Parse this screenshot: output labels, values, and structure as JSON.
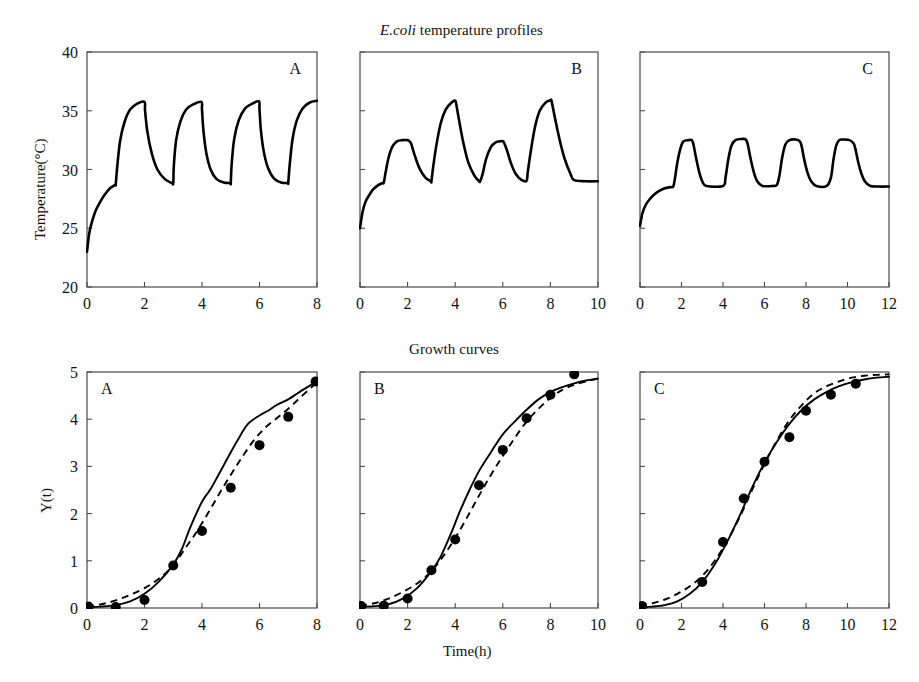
{
  "figure": {
    "top_title": "E.coli temperature profiles",
    "top_title_italic_part": "E.coli",
    "top_title_rest": " temperature profiles",
    "bottom_title": "Growth curves",
    "x_axis_label": "Time(h)",
    "top_y_axis_label": "Temperature(°C)",
    "bottom_y_axis_label": "Y(t)"
  },
  "chart_data": [
    {
      "type": "line",
      "id": "temperature-profile-a",
      "panel_letter": "A",
      "title": "E.coli temperature profiles",
      "xlabel": "",
      "ylabel": "Temperature(°C)",
      "xlim": [
        0,
        8
      ],
      "ylim": [
        20,
        40
      ],
      "xticks": [
        0,
        2,
        4,
        6,
        8
      ],
      "yticks": [
        20,
        25,
        30,
        35,
        40
      ],
      "xticklabels": [
        "0",
        "2",
        "4",
        "6",
        "8"
      ],
      "yticklabels": [
        "20",
        "25",
        "30",
        "35",
        "40"
      ],
      "grid": false,
      "legend": "none",
      "series": [
        {
          "name": "temperature",
          "x": [
            0,
            0.08,
            0.18,
            0.3,
            0.45,
            0.6,
            0.8,
            0.98,
            1.0,
            1.05,
            1.15,
            1.3,
            1.5,
            1.75,
            2.0,
            2.02,
            2.1,
            2.25,
            2.45,
            2.7,
            2.95,
            3.0,
            3.02,
            3.1,
            3.25,
            3.45,
            3.7,
            3.98,
            4.0,
            4.05,
            4.15,
            4.3,
            4.5,
            4.75,
            4.98,
            5.0,
            5.03,
            5.12,
            5.28,
            5.5,
            5.75,
            5.98,
            6.0,
            6.05,
            6.15,
            6.3,
            6.5,
            6.75,
            6.98,
            7.0,
            7.05,
            7.15,
            7.3,
            7.5,
            7.75,
            8.0
          ],
          "y": [
            23.0,
            24.6,
            25.6,
            26.5,
            27.2,
            27.8,
            28.4,
            28.7,
            28.75,
            30.2,
            32.4,
            34.0,
            35.1,
            35.6,
            35.75,
            35.0,
            33.2,
            31.4,
            30.0,
            29.2,
            28.85,
            28.85,
            30.3,
            32.5,
            34.1,
            35.1,
            35.55,
            35.75,
            35.1,
            33.3,
            31.4,
            30.0,
            29.2,
            28.9,
            28.85,
            28.85,
            30.4,
            32.6,
            34.2,
            35.2,
            35.6,
            35.8,
            35.1,
            33.3,
            31.5,
            30.1,
            29.25,
            28.9,
            28.85,
            28.9,
            30.4,
            32.6,
            34.2,
            35.2,
            35.7,
            35.85
          ]
        }
      ]
    },
    {
      "type": "line",
      "id": "temperature-profile-b",
      "panel_letter": "B",
      "title": "E.coli temperature profiles",
      "xlabel": "",
      "ylabel": "",
      "xlim": [
        0,
        10
      ],
      "ylim": [
        20,
        40
      ],
      "xticks": [
        0,
        2,
        4,
        6,
        8,
        10
      ],
      "yticks": [
        20,
        25,
        30,
        35,
        40
      ],
      "xticklabels": [
        "0",
        "2",
        "4",
        "6",
        "8",
        "10"
      ],
      "yticklabels": [
        "",
        "",
        "",
        "",
        ""
      ],
      "grid": false,
      "legend": "none",
      "series": [
        {
          "name": "temperature",
          "x": [
            0,
            0.1,
            0.22,
            0.38,
            0.55,
            0.75,
            0.95,
            1.0,
            1.08,
            1.2,
            1.35,
            1.55,
            1.8,
            2.0,
            2.05,
            2.15,
            2.3,
            2.5,
            2.75,
            2.98,
            3.0,
            3.08,
            3.22,
            3.4,
            3.6,
            3.85,
            4.0,
            4.05,
            4.18,
            4.35,
            4.55,
            4.8,
            5.0,
            5.05,
            5.15,
            5.3,
            5.5,
            5.7,
            5.9,
            6.0,
            6.05,
            6.18,
            6.35,
            6.55,
            6.8,
            7.0,
            7.05,
            7.18,
            7.35,
            7.55,
            7.8,
            8.0,
            8.05,
            8.18,
            8.38,
            8.6,
            8.85,
            9.0,
            9.5,
            10.0
          ],
          "y": [
            25.0,
            26.3,
            27.2,
            27.8,
            28.3,
            28.65,
            28.85,
            28.9,
            29.8,
            31.0,
            31.9,
            32.4,
            32.5,
            32.5,
            32.45,
            32.2,
            31.2,
            30.1,
            29.3,
            29.0,
            29.0,
            30.3,
            32.2,
            34.0,
            35.1,
            35.7,
            35.85,
            35.5,
            34.0,
            32.2,
            30.6,
            29.5,
            29.0,
            29.0,
            29.6,
            30.9,
            31.9,
            32.3,
            32.4,
            32.4,
            32.3,
            31.6,
            30.5,
            29.6,
            29.1,
            29.05,
            29.8,
            31.6,
            33.6,
            35.0,
            35.7,
            35.9,
            35.8,
            34.5,
            32.6,
            30.9,
            29.6,
            29.1,
            29.0,
            29.0
          ]
        }
      ]
    },
    {
      "type": "line",
      "id": "temperature-profile-c",
      "panel_letter": "C",
      "title": "E.coli temperature profiles",
      "xlabel": "",
      "ylabel": "",
      "xlim": [
        0,
        12
      ],
      "ylim": [
        20,
        40
      ],
      "xticks": [
        0,
        2,
        4,
        6,
        8,
        10,
        12
      ],
      "yticks": [
        20,
        25,
        30,
        35,
        40
      ],
      "xticklabels": [
        "0",
        "2",
        "4",
        "6",
        "8",
        "10",
        "12"
      ],
      "yticklabels": [
        "",
        "",
        "",
        "",
        ""
      ],
      "grid": false,
      "legend": "none",
      "series": [
        {
          "name": "temperature",
          "x": [
            0,
            0.12,
            0.28,
            0.48,
            0.7,
            0.95,
            1.2,
            1.45,
            1.6,
            1.68,
            1.8,
            1.95,
            2.1,
            2.35,
            2.5,
            2.58,
            2.7,
            2.85,
            3.0,
            3.2,
            4.0,
            4.12,
            4.25,
            4.4,
            4.6,
            4.9,
            5.1,
            5.2,
            5.32,
            5.48,
            5.65,
            5.9,
            6.4,
            6.6,
            6.72,
            6.85,
            7.0,
            7.2,
            7.5,
            7.7,
            7.8,
            7.92,
            8.08,
            8.25,
            8.5,
            9.0,
            9.2,
            9.32,
            9.45,
            9.6,
            9.8,
            10.1,
            10.3,
            10.4,
            10.52,
            10.68,
            10.85,
            11.1,
            11.5,
            12.0
          ],
          "y": [
            25.2,
            26.3,
            27.0,
            27.5,
            27.9,
            28.2,
            28.4,
            28.5,
            28.55,
            29.2,
            30.6,
            31.8,
            32.4,
            32.5,
            32.5,
            32.1,
            31.0,
            29.8,
            29.0,
            28.6,
            28.6,
            29.3,
            30.8,
            32.0,
            32.5,
            32.6,
            32.55,
            32.1,
            31.0,
            29.8,
            29.0,
            28.6,
            28.6,
            28.7,
            29.5,
            31.0,
            32.1,
            32.5,
            32.55,
            32.4,
            31.9,
            30.8,
            29.7,
            29.0,
            28.6,
            28.6,
            29.3,
            30.8,
            32.0,
            32.5,
            32.55,
            32.5,
            32.2,
            31.6,
            30.6,
            29.6,
            28.95,
            28.6,
            28.55,
            28.55
          ]
        }
      ]
    },
    {
      "type": "line",
      "id": "growth-curve-a",
      "panel_letter": "A",
      "title": "Growth curves",
      "xlabel": "Time(h)",
      "ylabel": "Y(t)",
      "xlim": [
        0,
        8
      ],
      "ylim": [
        0,
        5
      ],
      "xticks": [
        0,
        2,
        4,
        6,
        8
      ],
      "yticks": [
        0,
        1,
        2,
        3,
        4,
        5
      ],
      "xticklabels": [
        "0",
        "2",
        "4",
        "6",
        "8"
      ],
      "yticklabels": [
        "0",
        "1",
        "2",
        "3",
        "4",
        "5"
      ],
      "grid": false,
      "legend": "none",
      "series": [
        {
          "name": "model-solid",
          "style": "solid",
          "x": [
            0,
            0.5,
            1.0,
            1.5,
            2.0,
            2.5,
            3.0,
            3.3,
            3.6,
            4.0,
            4.3,
            4.6,
            5.0,
            5.3,
            5.6,
            6.0,
            6.3,
            6.6,
            7.0,
            7.4,
            8.0
          ],
          "y": [
            0.02,
            0.03,
            0.06,
            0.14,
            0.3,
            0.56,
            0.92,
            1.25,
            1.72,
            2.25,
            2.52,
            2.85,
            3.3,
            3.62,
            3.9,
            4.08,
            4.18,
            4.3,
            4.42,
            4.58,
            4.8
          ]
        },
        {
          "name": "model-dashed",
          "style": "dashed",
          "x": [
            0,
            0.5,
            1.0,
            1.5,
            2.0,
            2.5,
            3.0,
            3.4,
            3.8,
            4.2,
            4.6,
            5.0,
            5.4,
            5.8,
            6.2,
            6.6,
            7.0,
            7.4,
            8.0
          ],
          "y": [
            0.03,
            0.08,
            0.16,
            0.28,
            0.42,
            0.62,
            0.9,
            1.25,
            1.6,
            2.0,
            2.42,
            2.82,
            3.2,
            3.55,
            3.82,
            4.02,
            4.22,
            4.45,
            4.78
          ]
        }
      ],
      "points": {
        "x": [
          0.05,
          1.0,
          2.0,
          3.0,
          4.0,
          5.0,
          6.0,
          7.0,
          7.95
        ],
        "y": [
          0.03,
          0.02,
          0.17,
          0.9,
          1.63,
          2.55,
          3.45,
          4.05,
          4.8
        ]
      }
    },
    {
      "type": "line",
      "id": "growth-curve-b",
      "panel_letter": "B",
      "title": "Growth curves",
      "xlabel": "Time(h)",
      "ylabel": "",
      "xlim": [
        0,
        10
      ],
      "ylim": [
        0,
        5
      ],
      "xticks": [
        0,
        2,
        4,
        6,
        8,
        10
      ],
      "yticks": [
        0,
        1,
        2,
        3,
        4,
        5
      ],
      "xticklabels": [
        "0",
        "2",
        "4",
        "6",
        "8",
        "10"
      ],
      "yticklabels": [
        "",
        "",
        "",
        "",
        "",
        ""
      ],
      "grid": false,
      "legend": "none",
      "series": [
        {
          "name": "model-solid",
          "style": "solid",
          "x": [
            0,
            0.6,
            1.2,
            1.8,
            2.4,
            3.0,
            3.4,
            3.8,
            4.2,
            4.6,
            5.0,
            5.5,
            6.0,
            6.5,
            7.0,
            7.5,
            8.0,
            8.5,
            9.0,
            9.5,
            10.0
          ],
          "y": [
            0.02,
            0.04,
            0.08,
            0.2,
            0.42,
            0.78,
            1.1,
            1.55,
            2.05,
            2.5,
            2.9,
            3.3,
            3.68,
            3.95,
            4.2,
            4.42,
            4.58,
            4.68,
            4.76,
            4.82,
            4.86
          ]
        },
        {
          "name": "model-dashed",
          "style": "dashed",
          "x": [
            0,
            0.6,
            1.2,
            1.8,
            2.4,
            3.0,
            3.5,
            4.0,
            4.5,
            5.0,
            5.5,
            6.0,
            6.5,
            7.0,
            7.5,
            8.0,
            8.5,
            9.0,
            9.5,
            10.0
          ],
          "y": [
            0.05,
            0.1,
            0.2,
            0.34,
            0.52,
            0.78,
            1.1,
            1.48,
            1.92,
            2.38,
            2.82,
            3.22,
            3.6,
            3.95,
            4.22,
            4.45,
            4.62,
            4.73,
            4.8,
            4.86
          ]
        }
      ],
      "points": {
        "x": [
          0.05,
          1.0,
          2.0,
          3.0,
          4.0,
          5.0,
          6.0,
          7.0,
          8.0,
          9.0
        ],
        "y": [
          0.04,
          0.05,
          0.2,
          0.8,
          1.45,
          2.6,
          3.35,
          4.02,
          4.52,
          4.95
        ]
      }
    },
    {
      "type": "line",
      "id": "growth-curve-c",
      "panel_letter": "C",
      "title": "Growth curves",
      "xlabel": "Time(h)",
      "ylabel": "",
      "xlim": [
        0,
        12
      ],
      "ylim": [
        0,
        5
      ],
      "xticks": [
        0,
        2,
        4,
        6,
        8,
        10,
        12
      ],
      "yticks": [
        0,
        1,
        2,
        3,
        4,
        5
      ],
      "xticklabels": [
        "0",
        "2",
        "4",
        "6",
        "8",
        "10",
        "12"
      ],
      "yticklabels": [
        "",
        "",
        "",
        "",
        "",
        ""
      ],
      "grid": false,
      "legend": "none",
      "series": [
        {
          "name": "model-solid",
          "style": "solid",
          "x": [
            0,
            0.6,
            1.2,
            1.8,
            2.4,
            3.0,
            3.6,
            4.2,
            4.8,
            5.4,
            6.0,
            6.6,
            7.2,
            7.8,
            8.4,
            9.0,
            9.6,
            10.2,
            10.8,
            11.4,
            12.0
          ],
          "y": [
            0.02,
            0.03,
            0.06,
            0.14,
            0.3,
            0.55,
            0.92,
            1.4,
            1.95,
            2.55,
            3.08,
            3.52,
            3.9,
            4.2,
            4.42,
            4.58,
            4.7,
            4.78,
            4.84,
            4.88,
            4.9
          ]
        },
        {
          "name": "model-dashed",
          "style": "dashed",
          "x": [
            0,
            0.6,
            1.2,
            1.8,
            2.4,
            3.0,
            3.6,
            4.2,
            4.8,
            5.4,
            6.0,
            6.6,
            7.2,
            7.8,
            8.4,
            9.0,
            9.6,
            10.2,
            10.8,
            11.4,
            12.0
          ],
          "y": [
            0.05,
            0.1,
            0.18,
            0.3,
            0.46,
            0.68,
            1.0,
            1.42,
            1.92,
            2.5,
            3.05,
            3.55,
            3.98,
            4.3,
            4.55,
            4.7,
            4.8,
            4.88,
            4.92,
            4.94,
            4.95
          ]
        }
      ],
      "points": {
        "x": [
          0.1,
          3.0,
          4.0,
          5.0,
          6.0,
          7.2,
          8.0,
          9.2,
          10.4
        ],
        "y": [
          0.04,
          0.55,
          1.4,
          2.32,
          3.1,
          3.62,
          4.18,
          4.52,
          4.75
        ]
      }
    }
  ]
}
